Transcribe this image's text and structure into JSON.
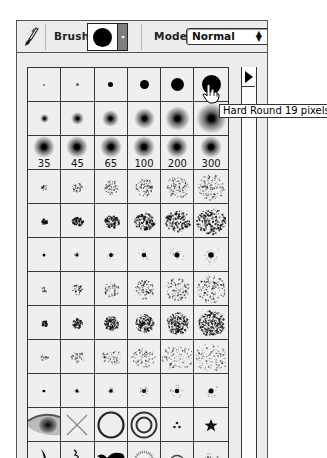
{
  "toolbar": {
    "tool_icon": "paintbrush-icon",
    "brush_label": "Brush:",
    "brush_preview": "hard-round-brush",
    "mode_label": "Mode:",
    "mode_value": "Normal"
  },
  "brush_palette": {
    "menu_arrow_icon": "triangle-right-icon",
    "columns": 6,
    "rows": [
      {
        "type": "hard-round",
        "sizes": [
          1,
          3,
          5,
          9,
          13,
          19
        ]
      },
      {
        "type": "soft-round",
        "sizes": [
          5,
          9,
          13,
          17,
          21,
          27
        ]
      },
      {
        "type": "soft-round-labeled",
        "labels": [
          "35",
          "45",
          "65",
          "100",
          "200",
          "300"
        ]
      },
      {
        "type": "spatter",
        "sizes": [
          "small",
          "small-medium",
          "medium",
          "medium-large",
          "large",
          "x-large"
        ]
      },
      {
        "type": "spatter-dense",
        "sizes": [
          "small",
          "small-medium",
          "medium",
          "medium-large",
          "large",
          "x-large"
        ]
      },
      {
        "type": "star-burst",
        "sizes": [
          "small",
          "small-medium",
          "medium",
          "medium-large",
          "large",
          "x-large"
        ]
      },
      {
        "type": "sparse-dots",
        "sizes": [
          "small",
          "small-medium",
          "medium",
          "medium-large",
          "large",
          "x-large"
        ]
      },
      {
        "type": "dense-dots",
        "sizes": [
          "small",
          "small-medium",
          "medium",
          "medium-large",
          "large",
          "x-large"
        ]
      },
      {
        "type": "flake-spatter",
        "sizes": [
          "small",
          "small-medium",
          "medium",
          "medium-large",
          "large",
          "x-large"
        ]
      },
      {
        "type": "fuzzy-star",
        "sizes": [
          "small",
          "small-medium",
          "medium",
          "medium-large",
          "large",
          "x-large"
        ]
      },
      {
        "type": "shapes",
        "items": [
          "eye",
          "cross",
          "ring",
          "double-ring",
          "three-dots",
          "star"
        ]
      },
      {
        "type": "shapes",
        "items": [
          "crescent",
          "squiggle",
          "duck",
          "fuzzy-ring",
          "thin-ring",
          "splatter"
        ]
      }
    ]
  },
  "tooltip": {
    "text": "Hard Round 19 pixels"
  },
  "cursor": "pointing-hand-cursor"
}
